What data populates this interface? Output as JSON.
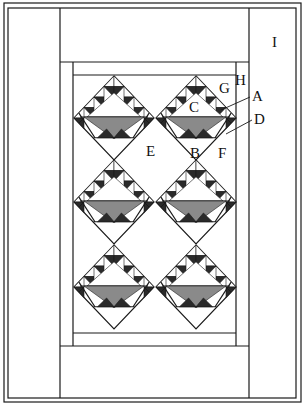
{
  "diagram": {
    "type": "quilt-layout",
    "colors": {
      "line": "#1a1a1a",
      "background": "#ffffff",
      "basket_fill": "#8a8a8a",
      "dark_triangle": "#2a2a2a"
    },
    "grid": {
      "columns": 2,
      "rows": 3
    },
    "blocks": [
      {
        "id": "r1c1",
        "cx": 114,
        "cy": 118
      },
      {
        "id": "r1c2",
        "cx": 196,
        "cy": 118
      },
      {
        "id": "r2c1",
        "cx": 114,
        "cy": 202
      },
      {
        "id": "r2c2",
        "cx": 196,
        "cy": 202
      },
      {
        "id": "r3c1",
        "cx": 114,
        "cy": 287
      },
      {
        "id": "r3c2",
        "cx": 196,
        "cy": 287
      }
    ],
    "labels": [
      {
        "text": "I",
        "x": 272,
        "y": 47,
        "part": "outer-side-border"
      },
      {
        "text": "H",
        "x": 235,
        "y": 85,
        "part": "inner-side-border"
      },
      {
        "text": "G",
        "x": 219,
        "y": 93,
        "part": "inner-top-border"
      },
      {
        "text": "A",
        "x": 252,
        "y": 101,
        "part": "small-triangle"
      },
      {
        "text": "C",
        "x": 189,
        "y": 112,
        "part": "basket-large-triangle"
      },
      {
        "text": "D",
        "x": 254,
        "y": 124,
        "part": "basket-side-strip"
      },
      {
        "text": "E",
        "x": 146,
        "y": 156,
        "part": "setting-square"
      },
      {
        "text": "B",
        "x": 190,
        "y": 158,
        "part": "basket-foot-triangle"
      },
      {
        "text": "F",
        "x": 218,
        "y": 158,
        "part": "side-setting-triangle"
      }
    ]
  }
}
